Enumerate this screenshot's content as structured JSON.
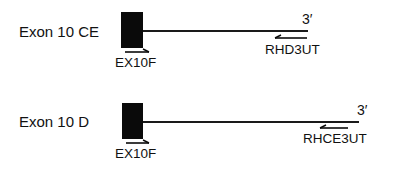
{
  "diagram": {
    "colors": {
      "ink": "#0a0a0a",
      "background": "#ffffff"
    },
    "constructs": [
      {
        "label": "Exon 10 CE",
        "end_label": "3′",
        "forward_primer": "EX10F",
        "reverse_primer": "RHD3UT"
      },
      {
        "label": "Exon 10 D",
        "end_label": "3′",
        "forward_primer": "EX10F",
        "reverse_primer": "RHCE3UT"
      }
    ]
  }
}
